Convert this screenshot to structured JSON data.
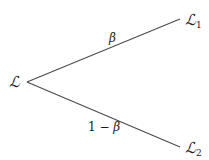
{
  "diagram": {
    "type": "tree",
    "nodes": [
      {
        "id": "root",
        "symbol": "ℒ",
        "subscript": ""
      },
      {
        "id": "child1",
        "symbol": "ℒ",
        "subscript": "1"
      },
      {
        "id": "child2",
        "symbol": "ℒ",
        "subscript": "2"
      }
    ],
    "edges": [
      {
        "from": "root",
        "to": "child1",
        "label_prefix": "",
        "label_var": "β"
      },
      {
        "from": "root",
        "to": "child2",
        "label_prefix": "1 − ",
        "label_var": "β"
      }
    ],
    "colors": {
      "line": "#4a4a4a",
      "text": "#1a1a1a",
      "background": "#ffffff"
    }
  }
}
